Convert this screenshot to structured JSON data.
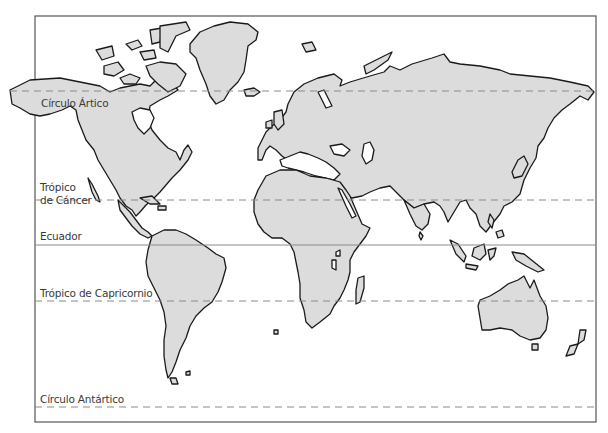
{
  "map": {
    "type": "world-outline-map",
    "land_color": "#dcdcdc",
    "coast_color": "#1a1a1a",
    "line_color": "#8a8a8a",
    "frame_color": "#555555"
  },
  "latitude_lines": [
    {
      "id": "arctic",
      "label": "Círculo Ártico",
      "style": "dashed",
      "y": 91
    },
    {
      "id": "cancer",
      "label_line1": "Trópico",
      "label_line2": "de Cáncer",
      "style": "dashed",
      "y": 200
    },
    {
      "id": "equator",
      "label": "Ecuador",
      "style": "solid",
      "y": 245
    },
    {
      "id": "capricorn",
      "label": "Trópico de Capricornio",
      "style": "dashed",
      "y": 301
    },
    {
      "id": "antarctic",
      "label": "Círculo Antártico",
      "style": "dashed",
      "y": 407
    }
  ]
}
